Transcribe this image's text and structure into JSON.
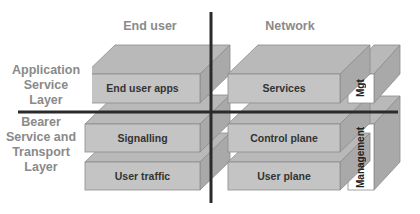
{
  "columns": {
    "end_user": "End user",
    "network": "Network"
  },
  "rows": {
    "application_service_layer": "Application\nService\nLayer",
    "bearer_service_transport_layer": "Bearer\nService and\nTransport\nLayer"
  },
  "boxes": {
    "end_user_apps": "End user apps",
    "services": "Services",
    "signalling": "Signalling",
    "control_plane": "Control plane",
    "user_traffic": "User traffic",
    "user_plane": "User plane",
    "mgt": "Mgt",
    "management": "Management"
  },
  "colors": {
    "front": "#c4c4c4",
    "top": "#b6b6b6",
    "side": "#a8a8a8",
    "edge": "#8c8c8c",
    "axis": "#2a2a2a",
    "header_text": "#8a8a8a",
    "mgmt_front": "#ffffff"
  }
}
